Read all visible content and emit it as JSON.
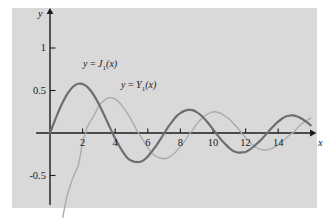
{
  "figure": {
    "background_color": "#ffffff",
    "panel_color": "#d9d9d9",
    "axis_color": "#1c1c1c"
  },
  "axes": {
    "x_axis_label": "x",
    "y_axis_label": "y",
    "x_ticks": [
      2,
      4,
      6,
      8,
      10,
      12,
      14
    ],
    "x_tick_labels": [
      "2",
      "4",
      "6",
      "8",
      "10",
      "12",
      "14"
    ],
    "y_ticks": [
      -0.5,
      0.5,
      1
    ],
    "y_tick_labels": [
      "-0.5",
      "0.5",
      "1"
    ],
    "xlim": [
      -0.9,
      16.0
    ],
    "ylim": [
      -0.95,
      1.25
    ]
  },
  "labels": {
    "j1": {
      "lhs": "y",
      "eq": "=",
      "fn": "J",
      "sub": "1",
      "arg": "(x)"
    },
    "y1": {
      "lhs": "y",
      "eq": "=",
      "fn": "Y",
      "sub": "1",
      "arg": "(x)"
    }
  },
  "chart_data": {
    "type": "line",
    "title": "",
    "xlabel": "x",
    "ylabel": "y",
    "xlim": [
      -0.9,
      16.0
    ],
    "ylim": [
      -0.95,
      1.25
    ],
    "grid": false,
    "legend": "inline-annotations",
    "xticks": [
      2,
      4,
      6,
      8,
      10,
      12,
      14
    ],
    "yticks": [
      -0.5,
      0.5,
      1
    ],
    "series": [
      {
        "name": "y = J_1(x)",
        "label": "y = J₁(x)",
        "color": "#6e6e6e",
        "linewidth": 2.2,
        "x": [
          0,
          0.25,
          0.5,
          0.75,
          1,
          1.25,
          1.5,
          1.75,
          1.8412,
          2,
          2.25,
          2.5,
          2.75,
          3,
          3.25,
          3.5,
          3.75,
          3.8317,
          4,
          4.25,
          4.5,
          4.75,
          5,
          5.25,
          5.3314,
          5.5,
          5.75,
          6,
          6.25,
          6.5,
          6.75,
          7,
          7.0156,
          7.25,
          7.5,
          7.75,
          8,
          8.25,
          8.5,
          8.5363,
          8.75,
          9,
          9.25,
          9.5,
          9.75,
          10,
          10.1735,
          10.25,
          10.5,
          10.75,
          11,
          11.25,
          11.5,
          11.6198,
          11.75,
          12,
          12.25,
          12.5,
          12.75,
          13,
          13.3237,
          13.5,
          13.75,
          14,
          14.25,
          14.5,
          14.75,
          14.8636,
          15,
          15.25,
          15.5,
          15.75,
          16
        ],
        "y": [
          0,
          0.124,
          0.2423,
          0.3492,
          0.4401,
          0.5106,
          0.5579,
          0.5802,
          0.5819,
          0.5767,
          0.5484,
          0.4971,
          0.4258,
          0.3391,
          0.242,
          0.1374,
          0.0339,
          0.0,
          -0.066,
          -0.1538,
          -0.2311,
          -0.2943,
          -0.3276,
          -0.3414,
          -0.3403,
          -0.3414,
          -0.3196,
          -0.2767,
          -0.2159,
          -0.1538,
          -0.0819,
          -0.0047,
          0.0,
          0.0726,
          0.1352,
          0.1957,
          0.2346,
          0.2601,
          0.2731,
          0.2731,
          0.2693,
          0.2453,
          0.2097,
          0.1613,
          0.1066,
          0.0435,
          0.0,
          -0.0185,
          -0.0789,
          -0.1296,
          -0.1768,
          -0.2127,
          -0.2284,
          -0.232,
          -0.2284,
          -0.2234,
          -0.1959,
          -0.1591,
          -0.115,
          -0.0703,
          0.0,
          0.038,
          0.089,
          0.1334,
          0.1709,
          0.196,
          0.2065,
          0.2069,
          0.2051,
          0.1882,
          0.1613,
          0.127,
          0.0904
        ]
      },
      {
        "name": "y = Y_1(x)",
        "label": "y = Y₁(x)",
        "color": "#a8a8a8",
        "linewidth": 1.3,
        "x": [
          0.18,
          0.25,
          0.4,
          0.6,
          0.8,
          1,
          1.25,
          1.5,
          1.75,
          2,
          2.197,
          2.25,
          2.5,
          2.75,
          3,
          3.25,
          3.5,
          3.75,
          4,
          4.25,
          4.5,
          4.75,
          5,
          5.25,
          5.4297,
          5.5,
          5.75,
          6,
          6.25,
          6.5,
          6.75,
          7,
          7.25,
          7.5,
          7.75,
          8,
          8.25,
          8.5,
          8.596,
          8.75,
          9,
          9.25,
          9.5,
          9.75,
          10,
          10.25,
          10.5,
          10.75,
          11,
          11.25,
          11.5,
          11.749,
          12,
          12.25,
          12.5,
          12.75,
          13,
          13.25,
          13.5,
          13.75,
          14,
          14.25,
          14.5,
          14.75,
          14.897,
          15,
          15.25,
          15.5,
          15.75,
          16
        ],
        "y": [
          -3.589,
          -2.704,
          -1.781,
          -1.26,
          -0.978,
          -0.781,
          -0.611,
          -0.481,
          -0.371,
          -0.107,
          0.0,
          0.0523,
          0.1459,
          0.2235,
          0.3247,
          0.3707,
          0.4102,
          0.4154,
          0.3979,
          0.3586,
          0.301,
          0.2296,
          0.1479,
          0.0608,
          0.0,
          -0.0207,
          -0.0979,
          -0.175,
          -0.2341,
          -0.2741,
          -0.2928,
          -0.3027,
          -0.289,
          -0.2592,
          -0.2166,
          -0.1581,
          -0.1025,
          -0.0262,
          0.0,
          0.0336,
          0.1043,
          0.159,
          0.2032,
          0.2322,
          0.249,
          0.2454,
          0.2276,
          0.1971,
          0.1637,
          0.1125,
          0.0615,
          0.0,
          -0.057,
          -0.1054,
          -0.1495,
          -0.1793,
          -0.197,
          -0.2005,
          -0.1901,
          -0.1687,
          -0.1401,
          -0.1002,
          -0.0588,
          -0.014,
          0.0,
          0.0211,
          0.075,
          0.1137,
          0.147,
          0.1749
        ]
      }
    ]
  }
}
